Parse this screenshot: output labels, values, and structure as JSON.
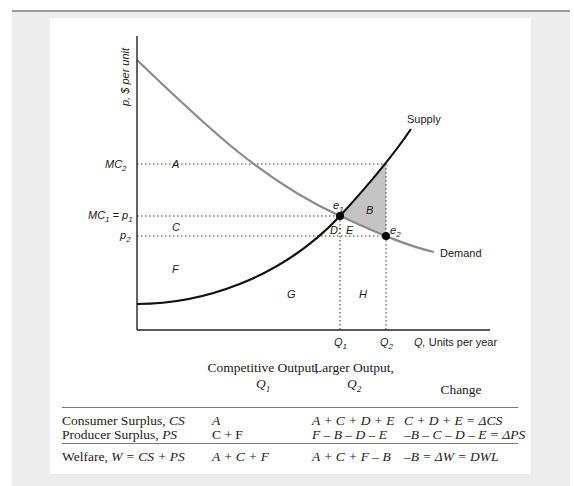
{
  "figure": {
    "y_axis_label": "p, $ per unit",
    "x_axis_label": "Q, Units per year",
    "y_ticks": [
      "MC2",
      "MC1 = p1",
      "p2"
    ],
    "x_ticks": [
      "Q1",
      "Q2"
    ],
    "curves": [
      {
        "name": "Supply",
        "label": "Supply",
        "color": "#111111"
      },
      {
        "name": "Demand",
        "label": "Demand",
        "color": "#8a8a8a"
      }
    ],
    "points": [
      {
        "name": "e1",
        "label": "e1"
      },
      {
        "name": "e2",
        "label": "e2"
      }
    ],
    "regions": [
      "A",
      "B",
      "C",
      "D",
      "E",
      "F",
      "G",
      "H"
    ],
    "shaded_region": {
      "label": "B",
      "color": "#c4c4c4"
    },
    "labels": {
      "y_axis": "p, $ per unit",
      "x_axis_q": "Q,",
      "x_axis_units": " Units per year",
      "mc2": "MC",
      "mc2_sub": "2",
      "mc1": "MC",
      "mc1_sub": "1",
      "mc1_eq": " = p",
      "mc1_eq_sub": "1",
      "p2": "p",
      "p2_sub": "2",
      "q1": "Q",
      "q1_sub": "1",
      "q2": "Q",
      "q2_sub": "2",
      "e1": "e",
      "e1_sub": "1",
      "e2": "e",
      "e2_sub": "2",
      "supply": "Supply",
      "demand": "Demand",
      "A": "A",
      "B": "B",
      "C": "C",
      "D": "D:",
      "E": "E",
      "F": "F",
      "G": "G",
      "H": "H"
    }
  },
  "table": {
    "headers": {
      "col1_line1": "Competitive Output,",
      "col1_line2": "Q",
      "col1_sub": "1",
      "col2_line1": "Larger Output,",
      "col2_line2": "Q",
      "col2_sub": "2",
      "col3": "Change"
    },
    "rows": [
      {
        "label": "Consumer Surplus, ",
        "label_ital": "CS",
        "competitive": "A",
        "larger": "A + C + D + E",
        "change": "C + D + E = ΔCS"
      },
      {
        "label": "Producer Surplus, ",
        "label_ital": "PS",
        "competitive": "C + F",
        "larger": "F – B – D – E",
        "change": "–B – C – D – E = ΔPS"
      },
      {
        "label": "Welfare, ",
        "label_ital": "W = CS + PS",
        "competitive": "A + C + F",
        "larger": "A + C + F – B",
        "change": "–B = ΔW = DWL"
      }
    ]
  }
}
